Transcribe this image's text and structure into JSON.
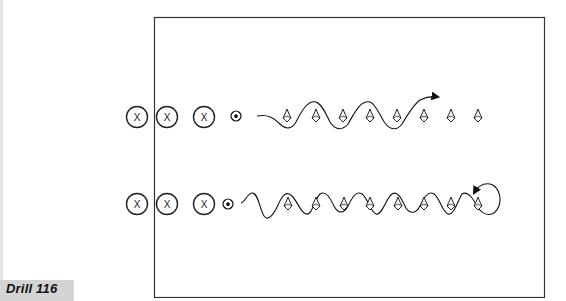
{
  "drill": {
    "label": "Drill 116",
    "label_bg": "#d4d4d4"
  },
  "field": {
    "x": 154,
    "y": 17,
    "width": 390,
    "height": 280,
    "stroke": "#333333"
  },
  "rows": [
    {
      "name": "top-row",
      "y": 117,
      "players": [
        {
          "x": 137,
          "label": "X"
        },
        {
          "x": 167,
          "label": "X"
        },
        {
          "x": 204,
          "label": "X"
        }
      ],
      "ball_x": 236,
      "cones": [
        287,
        316,
        343,
        370,
        397,
        424,
        451,
        478
      ],
      "path_end": "arrow-forward"
    },
    {
      "name": "bottom-row",
      "y": 204,
      "players": [
        {
          "x": 137,
          "label": "X"
        },
        {
          "x": 167,
          "label": "X"
        },
        {
          "x": 204,
          "label": "X"
        }
      ],
      "ball_x": 228,
      "cones": [
        288,
        316,
        344,
        370,
        398,
        424,
        451,
        478
      ],
      "path_end": "loop-back-arrow"
    }
  ],
  "icons": {
    "player": "circled-x-icon",
    "ball": "soccer-ball-icon",
    "cone": "cone-icon"
  }
}
